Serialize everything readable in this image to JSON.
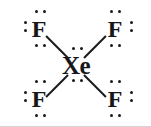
{
  "figure": {
    "kind": "lewis-structure",
    "molecule_formula": "XeF4",
    "background_color": "#ffffff",
    "ink_color": "#17171a",
    "edge_color": "#d8d6d2"
  },
  "atoms": [
    {
      "id": "f-top-left",
      "symbol": "F",
      "name": "fluorine-top-left",
      "x": 29,
      "y": 17,
      "lone_pair_positions": [
        "above",
        "left",
        "below"
      ],
      "lone_pair_count": 3
    },
    {
      "id": "f-top-right",
      "symbol": "F",
      "name": "fluorine-top-right",
      "x": 105,
      "y": 17,
      "lone_pair_positions": [
        "above",
        "right",
        "below"
      ],
      "lone_pair_count": 3
    },
    {
      "id": "xe-center",
      "symbol": "Xe",
      "name": "xenon-center",
      "x": 56,
      "y": 53,
      "lone_pair_positions": [
        "above",
        "below"
      ],
      "lone_pair_count": 2
    },
    {
      "id": "f-bottom-left",
      "symbol": "F",
      "name": "fluorine-bottom-left",
      "x": 29,
      "y": 87,
      "lone_pair_positions": [
        "above",
        "left",
        "below"
      ],
      "lone_pair_count": 3
    },
    {
      "id": "f-bottom-right",
      "symbol": "F",
      "name": "fluorine-bottom-right",
      "x": 105,
      "y": 87,
      "lone_pair_positions": [
        "above",
        "right",
        "below"
      ],
      "lone_pair_count": 3
    }
  ],
  "bonds": [
    {
      "id": "bond-xe-f-top-left",
      "from": "xe-center",
      "to": "f-top-left",
      "order": 1,
      "x1": 68,
      "y1": 57,
      "x2": 46,
      "y2": 35
    },
    {
      "id": "bond-xe-f-top-right",
      "from": "xe-center",
      "to": "f-top-right",
      "order": 1,
      "x1": 84,
      "y1": 57,
      "x2": 106,
      "y2": 35
    },
    {
      "id": "bond-xe-f-bottom-left",
      "from": "xe-center",
      "to": "f-bottom-left",
      "order": 1,
      "x1": 68,
      "y1": 74,
      "x2": 46,
      "y2": 96
    },
    {
      "id": "bond-xe-f-bottom-right",
      "from": "xe-center",
      "to": "f-bottom-right",
      "order": 1,
      "x1": 84,
      "y1": 74,
      "x2": 106,
      "y2": 96
    }
  ],
  "lone_pairs": [
    {
      "id": "lp-ftl-above",
      "atom": "f-top-left",
      "side": "above",
      "dots": [
        {
          "x": 35,
          "y": 10
        },
        {
          "x": 43,
          "y": 10
        }
      ]
    },
    {
      "id": "lp-ftl-left",
      "atom": "f-top-left",
      "side": "left",
      "dots": [
        {
          "x": 24,
          "y": 21
        },
        {
          "x": 24,
          "y": 29
        }
      ]
    },
    {
      "id": "lp-ftl-below",
      "atom": "f-top-left",
      "side": "below",
      "dots": [
        {
          "x": 35,
          "y": 44
        },
        {
          "x": 43,
          "y": 44
        }
      ]
    },
    {
      "id": "lp-ftr-above",
      "atom": "f-top-right",
      "side": "above",
      "dots": [
        {
          "x": 110,
          "y": 10
        },
        {
          "x": 118,
          "y": 10
        }
      ]
    },
    {
      "id": "lp-ftr-right",
      "atom": "f-top-right",
      "side": "right",
      "dots": [
        {
          "x": 130,
          "y": 21
        },
        {
          "x": 130,
          "y": 29
        }
      ]
    },
    {
      "id": "lp-ftr-below",
      "atom": "f-top-right",
      "side": "below",
      "dots": [
        {
          "x": 110,
          "y": 44
        },
        {
          "x": 118,
          "y": 44
        }
      ]
    },
    {
      "id": "lp-xe-above",
      "atom": "xe-center",
      "side": "above",
      "dots": [
        {
          "x": 72,
          "y": 47
        },
        {
          "x": 80,
          "y": 47
        }
      ]
    },
    {
      "id": "lp-xe-below",
      "atom": "xe-center",
      "side": "below",
      "dots": [
        {
          "x": 72,
          "y": 79
        },
        {
          "x": 80,
          "y": 79
        }
      ]
    },
    {
      "id": "lp-fbl-above",
      "atom": "f-bottom-left",
      "side": "above",
      "dots": [
        {
          "x": 35,
          "y": 80
        },
        {
          "x": 43,
          "y": 80
        }
      ]
    },
    {
      "id": "lp-fbl-left",
      "atom": "f-bottom-left",
      "side": "left",
      "dots": [
        {
          "x": 24,
          "y": 91
        },
        {
          "x": 24,
          "y": 99
        }
      ]
    },
    {
      "id": "lp-fbl-below",
      "atom": "f-bottom-left",
      "side": "below",
      "dots": [
        {
          "x": 35,
          "y": 114
        },
        {
          "x": 43,
          "y": 114
        }
      ]
    },
    {
      "id": "lp-fbr-above",
      "atom": "f-bottom-right",
      "side": "above",
      "dots": [
        {
          "x": 110,
          "y": 80
        },
        {
          "x": 118,
          "y": 80
        }
      ]
    },
    {
      "id": "lp-fbr-right",
      "atom": "f-bottom-right",
      "side": "right",
      "dots": [
        {
          "x": 130,
          "y": 91
        },
        {
          "x": 130,
          "y": 99
        }
      ]
    },
    {
      "id": "lp-fbr-below",
      "atom": "f-bottom-right",
      "side": "below",
      "dots": [
        {
          "x": 110,
          "y": 114
        },
        {
          "x": 118,
          "y": 114
        }
      ]
    }
  ],
  "labels": {
    "f_top_left": "F",
    "f_top_right": "F",
    "xe_center": "Xe",
    "f_bottom_left": "F",
    "f_bottom_right": "F"
  }
}
